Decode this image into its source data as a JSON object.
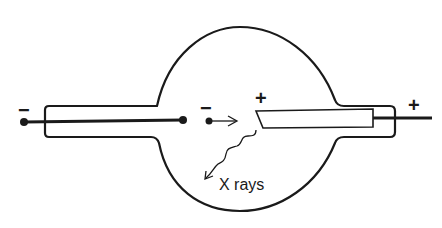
{
  "diagram": {
    "labels": {
      "xrays": "X rays",
      "cathode_terminal_sign": "−",
      "electron_sign": "−",
      "target_sign": "+",
      "anode_terminal_sign": "+"
    },
    "components": [
      {
        "id": "glass-bulb",
        "description": "Evacuated glass envelope (spherical bulb with side arms)"
      },
      {
        "id": "cathode",
        "description": "Negative electrode rod entering from the left"
      },
      {
        "id": "electron",
        "description": "Electron moving toward the target"
      },
      {
        "id": "anode-target",
        "description": "Positive slanted anode target"
      },
      {
        "id": "anode-rod",
        "description": "Positive electrode rod exiting to the right"
      },
      {
        "id": "xray-emission",
        "description": "Wavy arrow showing emitted X rays"
      }
    ],
    "colors": {
      "line": "#1a1a1a",
      "background": "#ffffff"
    }
  }
}
